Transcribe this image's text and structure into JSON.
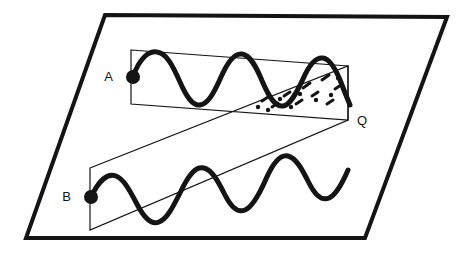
{
  "figure": {
    "type": "physics-wave-interference-diagram",
    "background_color": "#ffffff",
    "stroke_color": "#141414",
    "canvas": {
      "width": 463,
      "height": 253
    },
    "labels": [
      {
        "id": "A",
        "text": "A",
        "x": 113,
        "y": 77,
        "anchor": "end",
        "describes": "source-point-a"
      },
      {
        "id": "B",
        "text": "B",
        "x": 71,
        "y": 197,
        "anchor": "end",
        "describes": "source-point-b"
      },
      {
        "id": "Q",
        "text": "Q",
        "x": 357,
        "y": 121,
        "anchor": "start",
        "describes": "convergence-point-q"
      }
    ],
    "plane": {
      "name": "reference-plane",
      "shape": "parallelogram",
      "points": "105,15 447,17 365,238 26,238",
      "stroke_width": 4
    },
    "beam_a": {
      "name": "upper-beam-box",
      "shape": "parallelogram",
      "points": "131,50 348,66 348,120 131,104",
      "stroke_width": 1.2
    },
    "beam_b": {
      "name": "lower-beam-box",
      "shape": "parallelogram",
      "points": "90,168 348,66 348,120 90,230",
      "stroke_width": 1.2
    },
    "wave_a": {
      "name": "wave-a-path",
      "start_point": {
        "x": 133,
        "y": 77
      },
      "cycles": 3.25,
      "stroke_width": 5,
      "description": "sinusoid travelling left to right inside upper beam box"
    },
    "wave_b": {
      "name": "wave-b-path",
      "start_point": {
        "x": 91,
        "y": 197
      },
      "cycles": 3.1,
      "stroke_width": 5,
      "description": "sinusoid travelling up-right inside tilted lower beam box"
    },
    "source_dots": [
      {
        "name": "source-dot-a",
        "x": 133,
        "y": 77,
        "r": 7
      },
      {
        "name": "source-dot-b",
        "x": 91,
        "y": 197,
        "r": 7
      }
    ],
    "interference_marks": {
      "name": "interference-dash-marks",
      "stroke_width": 3,
      "segments": [
        {
          "x1": 262,
          "y1": 101,
          "x2": 268,
          "y2": 97
        },
        {
          "x1": 272,
          "y1": 107,
          "x2": 278,
          "y2": 103
        },
        {
          "x1": 284,
          "y1": 96,
          "x2": 290,
          "y2": 92
        },
        {
          "x1": 296,
          "y1": 104,
          "x2": 302,
          "y2": 100
        },
        {
          "x1": 303,
          "y1": 88,
          "x2": 310,
          "y2": 83
        },
        {
          "x1": 312,
          "y1": 96,
          "x2": 318,
          "y2": 92
        },
        {
          "x1": 322,
          "y1": 80,
          "x2": 329,
          "y2": 75
        },
        {
          "x1": 327,
          "y1": 104,
          "x2": 333,
          "y2": 100
        },
        {
          "x1": 335,
          "y1": 89,
          "x2": 341,
          "y2": 85
        }
      ],
      "dots": [
        {
          "x": 258,
          "y": 107
        },
        {
          "x": 268,
          "y": 110
        },
        {
          "x": 280,
          "y": 99
        },
        {
          "x": 291,
          "y": 107
        },
        {
          "x": 300,
          "y": 94
        },
        {
          "x": 316,
          "y": 100
        },
        {
          "x": 331,
          "y": 95
        },
        {
          "x": 338,
          "y": 78
        }
      ]
    }
  }
}
